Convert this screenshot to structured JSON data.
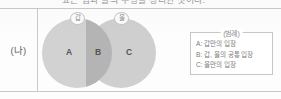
{
  "page": {
    "clipped_heading": "표는 갑과 을의 주장을 정리한 것이다.",
    "row_label": "(나)"
  },
  "venn": {
    "left_circle_tag": "갑",
    "right_circle_tag": "을",
    "region_a": "A",
    "region_b": "B",
    "region_c": "C"
  },
  "legend": {
    "title": "(범례)",
    "items": [
      {
        "text": "A: 갑만의 입장"
      },
      {
        "text": "B: 갑, 을의 공통 입장"
      },
      {
        "text": "C: 을만의 입장"
      }
    ]
  },
  "colors": {
    "circle_fill": "#d2d2d2",
    "intersection_fill": "#b4b4b4",
    "rule": "#c9c9c9",
    "text": "#6d6d6d",
    "legend_border": "#c6c6c6"
  }
}
